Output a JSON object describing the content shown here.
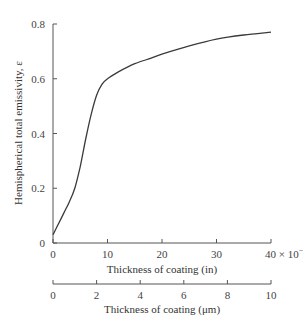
{
  "chart_data": {
    "type": "line",
    "title": "",
    "xlabel": "Thickness of coating (in)",
    "xlabel_secondary": "Thickness of coating (μm)",
    "ylabel": "Hemispherical total emissivity, ε",
    "x_scale_note": "× 10⁻⁵",
    "xlim": [
      0,
      40
    ],
    "ylim": [
      0,
      0.8
    ],
    "xlim_secondary": [
      0,
      10
    ],
    "x_ticks": [
      "0",
      "10",
      "20",
      "30",
      "40"
    ],
    "x_ticks_last_label": "40 × 10",
    "x_ticks_last_exp": "−5",
    "x_ticks_secondary": [
      "0",
      "2",
      "4",
      "6",
      "8",
      "10"
    ],
    "y_ticks": [
      "0",
      "0.2",
      "0.4",
      "0.6",
      "0.8"
    ],
    "grid": false,
    "legend": null,
    "series": [
      {
        "name": "Hemispherical total emissivity",
        "x": [
          0,
          1,
          2,
          3,
          4,
          5,
          6,
          7,
          8,
          9,
          10,
          12,
          15,
          18,
          20,
          25,
          30,
          35,
          40
        ],
        "y": [
          0.03,
          0.07,
          0.11,
          0.15,
          0.2,
          0.28,
          0.38,
          0.47,
          0.54,
          0.58,
          0.6,
          0.625,
          0.655,
          0.675,
          0.69,
          0.72,
          0.745,
          0.76,
          0.77
        ]
      }
    ]
  }
}
